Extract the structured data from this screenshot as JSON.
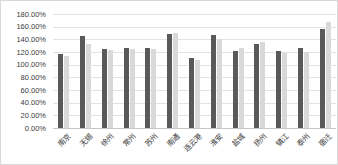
{
  "chart_data": {
    "type": "bar",
    "title": "",
    "xlabel": "",
    "ylabel": "",
    "categories": [
      "南京",
      "无锡",
      "徐州",
      "常州",
      "苏州",
      "南通",
      "连云港",
      "淮安",
      "盐城",
      "扬州",
      "镇江",
      "泰州",
      "宿迁"
    ],
    "series": [
      {
        "name": "series-dark",
        "color": "#595959",
        "values": [
          117,
          146,
          125,
          126,
          126,
          148,
          110,
          147,
          122,
          133,
          121,
          126,
          157
        ]
      },
      {
        "name": "series-light",
        "color": "#d9d9d9",
        "values": [
          113,
          132,
          123,
          125,
          125,
          150,
          108,
          141,
          126,
          136,
          119,
          120,
          167
        ]
      }
    ],
    "ylim": [
      0,
      180
    ],
    "ytick_step": 20,
    "ytick_labels": [
      "0.00%",
      "20.00%",
      "40.00%",
      "60.00%",
      "80.00%",
      "100.00%",
      "120.00%",
      "140.00%",
      "160.00%",
      "180.00%"
    ],
    "grid": true,
    "legend": false,
    "colors": {
      "background": "#ffffff",
      "gridline": "#e3e3e3",
      "axis_text": "#3b3b3b",
      "bar_dark": "#595959",
      "bar_light": "#d9d9d9"
    }
  }
}
